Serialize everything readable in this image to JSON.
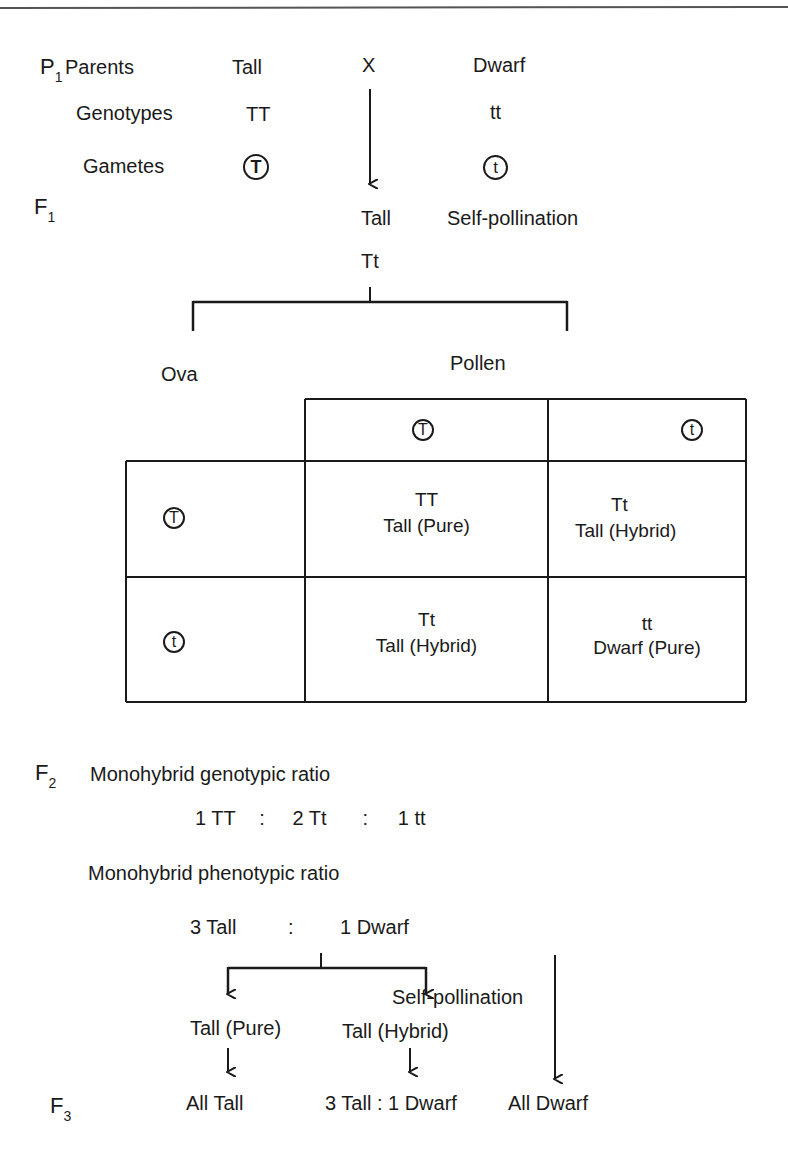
{
  "p1": {
    "generation_label": "P",
    "generation_sub": "1",
    "row_label_parents": "Parents",
    "row_label_genotypes": "Genotypes",
    "row_label_gametes": "Gametes",
    "tall_parent": "Tall",
    "cross_symbol": "X",
    "dwarf_parent": "Dwarf",
    "tall_genotype": "TT",
    "dwarf_genotype": "tt",
    "tall_gamete": "T",
    "dwarf_gamete": "t"
  },
  "f1": {
    "generation_label": "F",
    "generation_sub": "1",
    "phenotype": "Tall",
    "genotype": "Tt",
    "process": "Self-pollination"
  },
  "punnett": {
    "ova_label": "Ova",
    "pollen_label": "Pollen",
    "pollen_gametes": [
      "T",
      "t"
    ],
    "ova_gametes": [
      "T",
      "t"
    ],
    "cells": [
      [
        {
          "genotype": "TT",
          "phenotype": "Tall (Pure)"
        },
        {
          "genotype": "Tt",
          "phenotype": "Tall (Hybrid)"
        }
      ],
      [
        {
          "genotype": "Tt",
          "phenotype": "Tall (Hybrid)"
        },
        {
          "genotype": "tt",
          "phenotype": "Dwarf (Pure)"
        }
      ]
    ]
  },
  "f2": {
    "generation_label": "F",
    "generation_sub": "2",
    "genotypic_title": "Monohybrid genotypic ratio",
    "genotypic_ratio": [
      "1 TT",
      ":",
      "2 Tt",
      ":",
      "1 tt"
    ],
    "phenotypic_title": "Monohybrid phenotypic ratio",
    "phenotypic_tall": "3 Tall",
    "phenotypic_colon": ":",
    "phenotypic_dwarf": "1 Dwarf",
    "tall_pure": "Tall (Pure)",
    "tall_hybrid": "Tall (Hybrid)",
    "process": "Self-pollination"
  },
  "f3": {
    "generation_label": "F",
    "generation_sub": "3",
    "from_pure": "All Tall",
    "from_hybrid": "3 Tall : 1 Dwarf",
    "from_dwarf": "All Dwarf"
  }
}
